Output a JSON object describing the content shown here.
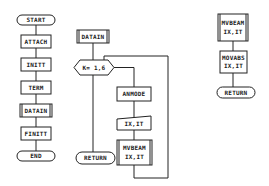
{
  "diagram": {
    "type": "flowchart",
    "main_flow": {
      "start": "START",
      "steps": [
        "ATTACH",
        "INITT",
        "TERM",
        "DATAIN",
        "FINITT"
      ],
      "end": "END"
    },
    "datain_subroutine": {
      "title": "DATAIN",
      "loop": "K= 1,6",
      "steps": [
        "ANMODE",
        "IX,IT"
      ],
      "call": {
        "line1": "MVBEAM",
        "line2": "IX,IT"
      },
      "exit": "RETURN"
    },
    "mvbeam_subroutine": {
      "title": {
        "line1": "MVBEAM",
        "line2": "IX,IT"
      },
      "step": {
        "line1": "MOVABS",
        "line2": "IX,IT"
      },
      "exit": "RETURN"
    }
  }
}
